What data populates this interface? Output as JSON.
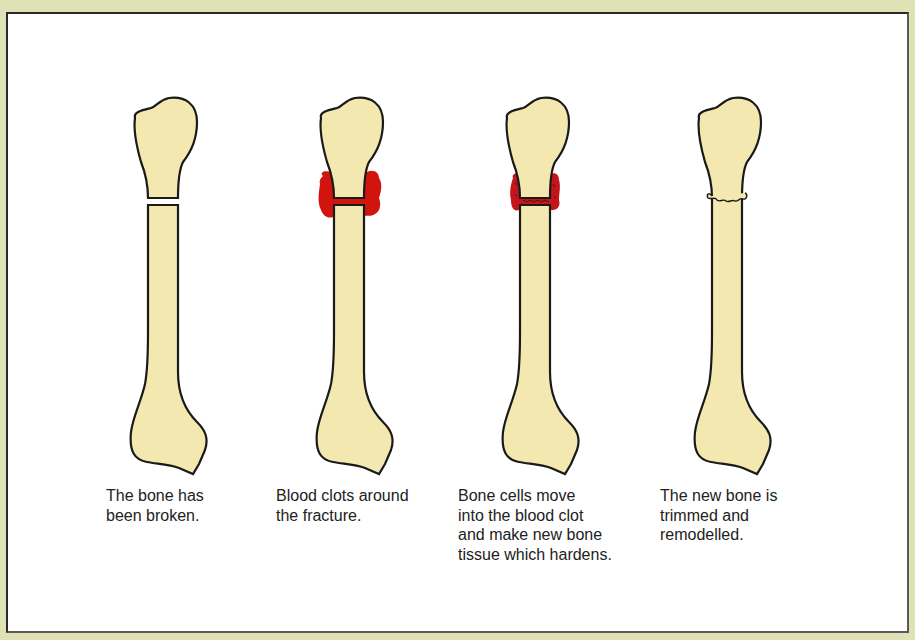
{
  "colors": {
    "background": "#dfe2b4",
    "panel": "#ffffff",
    "bone_fill": "#f3e9b0",
    "bone_outline": "#1a1a1a",
    "blood_clot": "#d2140f",
    "new_bone_clot": "#c4161a"
  },
  "stages": [
    {
      "id": "broken",
      "caption": "The bone has\nbeen broken."
    },
    {
      "id": "clot",
      "caption": "Blood clots around\nthe fracture."
    },
    {
      "id": "new-tissue",
      "caption": "Bone cells move\ninto the blood clot\nand make new bone\ntissue which hardens."
    },
    {
      "id": "remodelled",
      "caption": "The new bone is\ntrimmed and\nremodelled."
    }
  ]
}
